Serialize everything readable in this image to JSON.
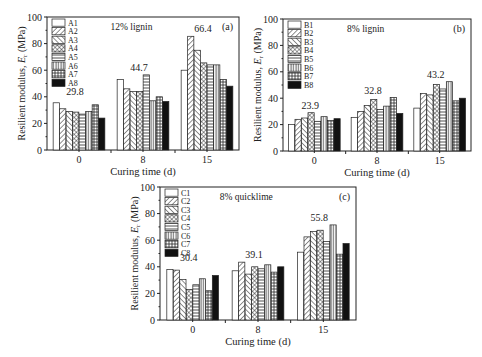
{
  "figure": {
    "patterns": [
      "empty",
      "forward-diagonal",
      "back-diagonal",
      "crosshatch",
      "horizontal",
      "vertical",
      "grid",
      "solid"
    ]
  },
  "chart_data": [
    {
      "id": "a",
      "type": "bar",
      "panel_label": "(a)",
      "title": "12% lignin",
      "xlabel": "Curing time (d)",
      "ylabel": "Resilient modulus, E_r (MPa)",
      "ylabel_main": "Resilient modulus, ",
      "ylabel_var": "E",
      "ylabel_sub": "r",
      "ylabel_unit": " (MPa)",
      "ylim": [
        0,
        100
      ],
      "yticks": [
        0,
        20,
        40,
        60,
        80,
        100
      ],
      "grid": false,
      "legend_position": "upper-left",
      "categories": [
        "0",
        "8",
        "15"
      ],
      "group_annotations": [
        "29.8",
        "44.7",
        "66.4"
      ],
      "series": [
        {
          "name": "A1",
          "values": [
            35.5,
            53,
            60
          ]
        },
        {
          "name": "A2",
          "values": [
            31,
            46,
            85.5
          ]
        },
        {
          "name": "A3",
          "values": [
            29,
            44,
            75
          ]
        },
        {
          "name": "A4",
          "values": [
            28.5,
            44,
            65.5
          ]
        },
        {
          "name": "A5",
          "values": [
            27,
            56.5,
            64
          ]
        },
        {
          "name": "A6",
          "values": [
            29,
            37,
            64
          ]
        },
        {
          "name": "A7",
          "values": [
            34,
            40,
            53
          ]
        },
        {
          "name": "A8",
          "values": [
            24,
            36.5,
            48
          ]
        }
      ],
      "frame": {
        "x0": 47,
        "x1": 239,
        "y0": 17,
        "y1": 150
      }
    },
    {
      "id": "b",
      "type": "bar",
      "panel_label": "(b)",
      "title": "8% lignin",
      "xlabel": "Curing time (d)",
      "ylabel": "Resilient modulus, E_r (MPa)",
      "ylabel_main": "Resilient modulus, ",
      "ylabel_var": "E",
      "ylabel_sub": "r",
      "ylabel_unit": " (MPa)",
      "ylim": [
        0,
        100
      ],
      "yticks": [
        0,
        20,
        40,
        60,
        80,
        100
      ],
      "grid": false,
      "legend_position": "upper-left",
      "categories": [
        "0",
        "8",
        "15"
      ],
      "group_annotations": [
        "23.9",
        "32.8",
        "43.2"
      ],
      "series": [
        {
          "name": "B1",
          "values": [
            20,
            25.5,
            32.5
          ]
        },
        {
          "name": "B2",
          "values": [
            24,
            30,
            43.5
          ]
        },
        {
          "name": "B3",
          "values": [
            25,
            34.5,
            42.5
          ]
        },
        {
          "name": "B4",
          "values": [
            29,
            39,
            50.5
          ]
        },
        {
          "name": "B5",
          "values": [
            22.5,
            31.5,
            47
          ]
        },
        {
          "name": "B6",
          "values": [
            26,
            34,
            52.5
          ]
        },
        {
          "name": "B7",
          "values": [
            23,
            40.5,
            38
          ]
        },
        {
          "name": "B8",
          "values": [
            24.5,
            28.5,
            40
          ]
        }
      ],
      "frame": {
        "x0": 283,
        "x1": 471,
        "y0": 19,
        "y1": 151
      }
    },
    {
      "id": "c",
      "type": "bar",
      "panel_label": "(c)",
      "title": "8% quicklime",
      "xlabel": "Curing time (d)",
      "ylabel": "Resilient modulus, E_r (MPa)",
      "ylabel_main": "Resilient modulus, ",
      "ylabel_var": "E",
      "ylabel_sub": "r",
      "ylabel_unit": " (MPa)",
      "ylim": [
        0,
        100
      ],
      "yticks": [
        0,
        20,
        40,
        60,
        80,
        100
      ],
      "grid": false,
      "legend_position": "upper-left",
      "categories": [
        "0",
        "8",
        "15"
      ],
      "group_annotations": [
        "30.4",
        "39.1",
        "55.8"
      ],
      "series": [
        {
          "name": "C1",
          "values": [
            38,
            37,
            51
          ]
        },
        {
          "name": "C2",
          "values": [
            37.5,
            43.5,
            62.5
          ]
        },
        {
          "name": "C3",
          "values": [
            30.5,
            34.5,
            66.5
          ]
        },
        {
          "name": "C4",
          "values": [
            23,
            40,
            67.5
          ]
        },
        {
          "name": "C5",
          "values": [
            26.5,
            38.5,
            59
          ]
        },
        {
          "name": "C6",
          "values": [
            31,
            41.5,
            71.5
          ]
        },
        {
          "name": "C7",
          "values": [
            22,
            36,
            49.5
          ]
        },
        {
          "name": "C8",
          "values": [
            33.5,
            40,
            57.5
          ]
        }
      ],
      "frame": {
        "x0": 160,
        "x1": 356,
        "y0": 187,
        "y1": 320
      }
    }
  ]
}
